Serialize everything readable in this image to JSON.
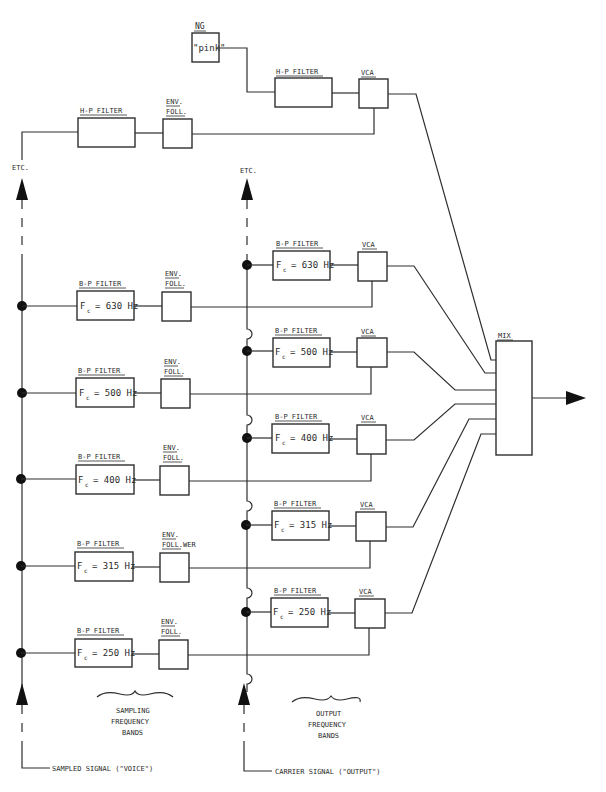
{
  "diagram": {
    "noise": {
      "label": "NG",
      "content": "\"pink\"",
      "hp_filter_label": "H-P FILTER",
      "vca_label": "VCA"
    },
    "sampling_hp": {
      "filter_label": "H-P FILTER",
      "env_label_1": "ENV.",
      "env_label_2": "FOLL."
    },
    "etc_left": "ETC.",
    "etc_right": "ETC.",
    "analysis_bands": [
      {
        "filter_label": "B-P FILTER",
        "fc_label": "F",
        "fc_sub": "c",
        "fc_value": "= 630 Hz",
        "env_1": "ENV.",
        "env_2": "FOLL."
      },
      {
        "filter_label": "B-P FILTER",
        "fc_label": "F",
        "fc_sub": "c",
        "fc_value": "= 500 Hz",
        "env_1": "ENV.",
        "env_2": "FOLL."
      },
      {
        "filter_label": "B-P FILTER",
        "fc_label": "F",
        "fc_sub": "c",
        "fc_value": "= 400 Hz",
        "env_1": "ENV.",
        "env_2": "FOLL."
      },
      {
        "filter_label": "B-P FILTER",
        "fc_label": "F",
        "fc_sub": "c",
        "fc_value": "= 315 Hz",
        "env_1": "ENV.",
        "env_2": "FOLL.WER"
      },
      {
        "filter_label": "B-P FILTER",
        "fc_label": "F",
        "fc_sub": "c",
        "fc_value": "= 250 Hz",
        "env_1": "ENV.",
        "env_2": "FOLL."
      }
    ],
    "synthesis_bands": [
      {
        "filter_label": "B-P FILTER",
        "fc_label": "F",
        "fc_sub": "c",
        "fc_value": "= 630 Hz",
        "vca_label": "VCA"
      },
      {
        "filter_label": "B-P FILTER",
        "fc_label": "F",
        "fc_sub": "c",
        "fc_value": "= 500 Hz",
        "vca_label": "VCA"
      },
      {
        "filter_label": "B-P FILTER",
        "fc_label": "F",
        "fc_sub": "c",
        "fc_value": "= 400 Hz",
        "vca_label": "VCA"
      },
      {
        "filter_label": "B-P FILTER",
        "fc_label": "F",
        "fc_sub": "c",
        "fc_value": "= 315 Hz",
        "vca_label": "VCA"
      },
      {
        "filter_label": "B-P FILTER",
        "fc_label": "F",
        "fc_sub": "c",
        "fc_value": "= 250 Hz",
        "vca_label": "VCA"
      }
    ],
    "mix_label": "MIX",
    "sampling_caption": [
      "SAMPLING",
      "FREQUENCY",
      "BANDS"
    ],
    "output_caption": [
      "OUTPUT",
      "FREQUENCY",
      "BANDS"
    ],
    "sampled_signal_label": "SAMPLED SIGNAL (\"VOICE\")",
    "carrier_signal_label": "CARRIER SIGNAL (\"OUTPUT\")"
  }
}
